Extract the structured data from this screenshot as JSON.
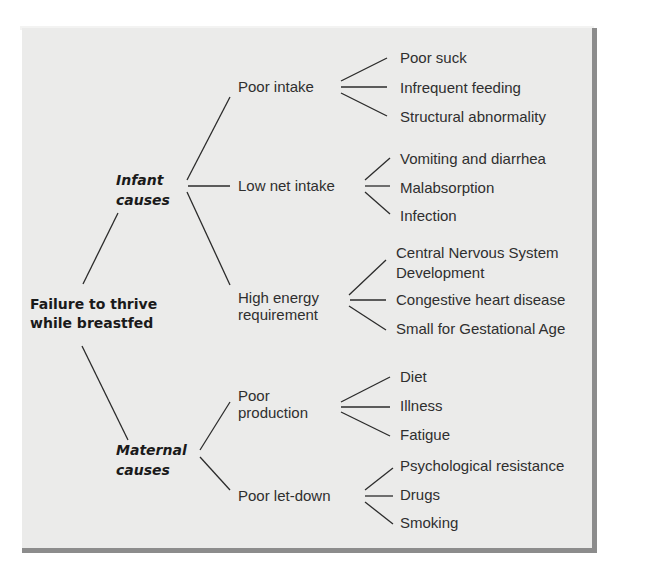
{
  "diagram": {
    "root": {
      "line1": "Failure to thrive",
      "line2": "while breastfed"
    },
    "categories": [
      {
        "line1": "Infant",
        "line2": "causes",
        "branches": [
          {
            "label": "Poor intake",
            "leaves": [
              "Poor suck",
              "Infrequent feeding",
              "Structural abnormality"
            ]
          },
          {
            "label": "Low net intake",
            "leaves": [
              "Vomiting and diarrhea",
              "Malabsorption",
              "Infection"
            ]
          },
          {
            "line1": "High energy",
            "line2": "requirement",
            "leaves": [
              "Central Nervous System",
              "Development",
              "Congestive heart disease",
              "Small for Gestational Age"
            ]
          }
        ]
      },
      {
        "line1": "Maternal",
        "line2": "causes",
        "branches": [
          {
            "line1": "Poor",
            "line2": "production",
            "leaves": [
              "Diet",
              "Illness",
              "Fatigue"
            ]
          },
          {
            "label": "Poor let-down",
            "leaves": [
              "Psychological resistance",
              "Drugs",
              "Smoking"
            ]
          }
        ]
      }
    ]
  },
  "colors": {
    "panel": "#ebebea",
    "shadow": "#8c8c8c",
    "text": "#2f2f2f",
    "line": "#2b2b2b"
  }
}
